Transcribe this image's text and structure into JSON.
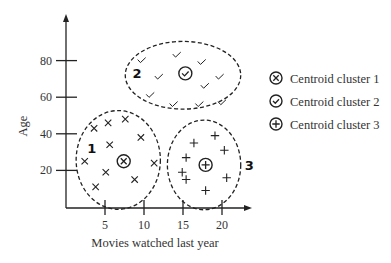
{
  "chart_data": {
    "type": "scatter",
    "title": "",
    "xlabel": "Movies watched last year",
    "ylabel": "Age",
    "xlim": [
      0,
      25
    ],
    "ylim": [
      0,
      95
    ],
    "xticks": [
      5,
      10,
      15,
      20
    ],
    "yticks": [
      20,
      40,
      60,
      80
    ],
    "grid": false,
    "legend_position": "right",
    "series": [
      {
        "name": "Cluster 1",
        "label": "1",
        "marker": "x",
        "points": [
          [
            3.6,
            43
          ],
          [
            5.4,
            46
          ],
          [
            7.6,
            48
          ],
          [
            9.6,
            38
          ],
          [
            5.6,
            34
          ],
          [
            2.4,
            25
          ],
          [
            11.3,
            24
          ],
          [
            5.1,
            19
          ],
          [
            8.8,
            15
          ],
          [
            3.8,
            11
          ]
        ],
        "centroid": [
          7.4,
          25
        ],
        "ellipse": {
          "cx": 6.7,
          "cy": 25.7,
          "rx": 5.4,
          "ry": 27
        }
      },
      {
        "name": "Cluster 2",
        "label": "2",
        "marker": "check",
        "points": [
          [
            9.7,
            80
          ],
          [
            14.2,
            83
          ],
          [
            17.4,
            79
          ],
          [
            11.9,
            71
          ],
          [
            19.7,
            71
          ],
          [
            17.8,
            66
          ],
          [
            10.8,
            61
          ],
          [
            13.8,
            56
          ],
          [
            17.1,
            56
          ],
          [
            20,
            57
          ]
        ],
        "centroid": [
          15.3,
          73
        ],
        "ellipse": {
          "cx": 15,
          "cy": 72,
          "rx": 7.4,
          "ry": 18.5
        }
      },
      {
        "name": "Cluster 3",
        "label": "3",
        "marker": "plus",
        "points": [
          [
            16.4,
            35
          ],
          [
            19.1,
            39
          ],
          [
            15.4,
            27
          ],
          [
            20.3,
            31
          ],
          [
            14.9,
            19
          ],
          [
            20.6,
            16
          ],
          [
            15.4,
            15
          ],
          [
            17.9,
            9
          ]
        ],
        "centroid": [
          17.9,
          23
        ],
        "ellipse": {
          "cx": 17.7,
          "cy": 23,
          "rx": 4.7,
          "ry": 24.5
        }
      }
    ],
    "legend": [
      {
        "marker": "circle-x",
        "label": "Centroid cluster 1"
      },
      {
        "marker": "circle-check",
        "label": "Centroid cluster 2"
      },
      {
        "marker": "circle-plus",
        "label": "Centroid cluster 3"
      }
    ]
  },
  "colors": {
    "ink": "#222222",
    "text": "#333333"
  }
}
